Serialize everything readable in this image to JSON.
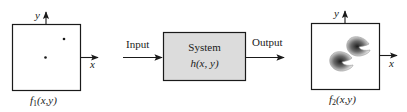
{
  "diagram": {
    "type": "block-diagram",
    "input_panel": {
      "caption_func": "f",
      "caption_sub": "1",
      "caption_args": "(x,y)",
      "x_axis_label": "x",
      "y_axis_label": "y",
      "content": "two impulse points"
    },
    "system": {
      "title": "System",
      "function": "h(x, y)",
      "fill_color": "#dcdcdc"
    },
    "input_arrow_label": "Input",
    "output_arrow_label": "Output",
    "output_panel": {
      "caption_func": "f",
      "caption_sub": "2",
      "caption_args": "(x,y)",
      "x_axis_label": "x",
      "y_axis_label": "y",
      "content": "two blurred crescent shapes (impulse responses)"
    },
    "colors": {
      "stroke": "#1a1a1a",
      "system_fill": "#dcdcdc",
      "blob_dark": "#2a2a2a",
      "blob_light": "#e8e8e8"
    }
  }
}
